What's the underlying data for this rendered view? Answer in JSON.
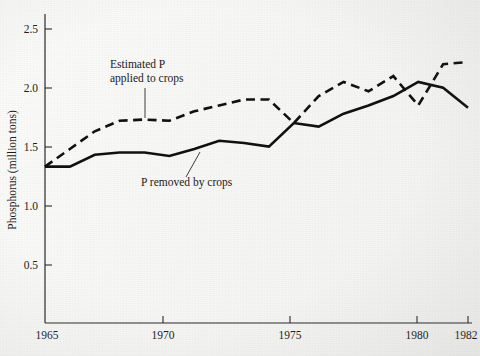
{
  "chart_data": {
    "type": "line",
    "title": "",
    "xlabel": "",
    "ylabel": "Phosphorus (million tons)",
    "xlim": [
      1965,
      1982
    ],
    "ylim": [
      0,
      2.6
    ],
    "grid": false,
    "legend_position": "inline-annotations",
    "x_ticks": [
      "1965",
      "1970",
      "1975",
      "1980",
      "1982"
    ],
    "x_tick_values": [
      1965,
      1970,
      1975,
      1980,
      1982
    ],
    "y_ticks": [
      "0.5",
      "1.0",
      "1.5",
      "2.0",
      "2.5"
    ],
    "y_tick_values": [
      0.5,
      1.0,
      1.5,
      2.0,
      2.5
    ],
    "x": [
      1965,
      1966,
      1967,
      1968,
      1969,
      1970,
      1971,
      1972,
      1973,
      1974,
      1975,
      1976,
      1977,
      1978,
      1979,
      1980,
      1981,
      1982
    ],
    "series": [
      {
        "name": "Estimated P applied to crops",
        "style": "dashed",
        "color": "#111111",
        "values": [
          1.33,
          1.48,
          1.63,
          1.72,
          1.73,
          1.72,
          1.8,
          1.85,
          1.9,
          1.9,
          1.7,
          1.93,
          2.05,
          1.97,
          2.1,
          1.85,
          2.2,
          2.22
        ]
      },
      {
        "name": "P removed by crops",
        "style": "solid",
        "color": "#111111",
        "values": [
          1.33,
          1.33,
          1.43,
          1.45,
          1.45,
          1.42,
          1.48,
          1.55,
          1.53,
          1.5,
          1.7,
          1.67,
          1.78,
          1.85,
          1.93,
          2.05,
          2.0,
          1.83
        ]
      }
    ],
    "annotations": [
      {
        "id": "estimated-p-annotation",
        "line1": "Estimated P",
        "line2": "applied to crops",
        "text_x": 110,
        "text_y1": 68,
        "text_y2": 82,
        "leader": {
          "x1": 145,
          "y1": 88,
          "x2": 145,
          "y2": 118
        }
      },
      {
        "id": "p-removed-annotation",
        "line1": "P removed by crops",
        "line2": "",
        "text_x": 141,
        "text_y1": 183,
        "text_y2": 183,
        "leader": {
          "x1": 185,
          "y1": 177,
          "x2": 200,
          "y2": 152
        }
      }
    ]
  },
  "axes": {
    "y_title": "Phosphorus (million tons)"
  }
}
